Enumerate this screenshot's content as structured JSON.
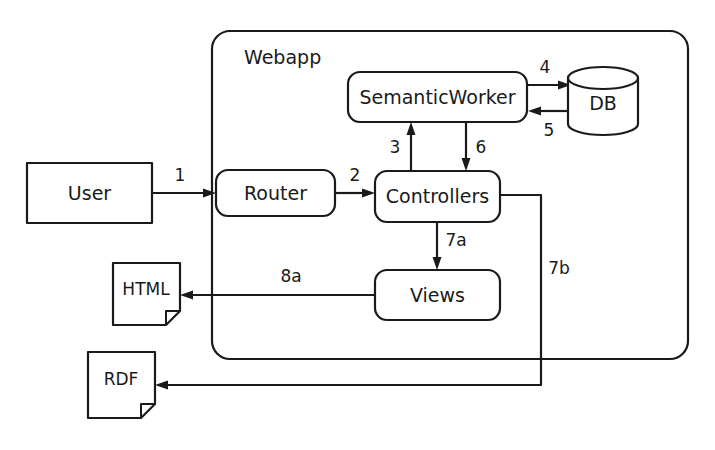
{
  "diagram": {
    "background_color": "#ffffff",
    "stroke_color": "#1a1a1a",
    "container": {
      "label": "Webapp",
      "shape": "rounded-rectangle"
    },
    "nodes": [
      {
        "id": "user",
        "label": "User",
        "shape": "rectangle"
      },
      {
        "id": "router",
        "label": "Router",
        "shape": "rounded-rectangle"
      },
      {
        "id": "controllers",
        "label": "Controllers",
        "shape": "rounded-rectangle"
      },
      {
        "id": "semantic-worker",
        "label": "SemanticWorker",
        "shape": "rounded-rectangle"
      },
      {
        "id": "db",
        "label": "DB",
        "shape": "cylinder"
      },
      {
        "id": "views",
        "label": "Views",
        "shape": "rounded-rectangle"
      },
      {
        "id": "html",
        "label": "HTML",
        "shape": "document"
      },
      {
        "id": "rdf",
        "label": "RDF",
        "shape": "document"
      }
    ],
    "edges": [
      {
        "id": "e1",
        "label": "1",
        "from": "user",
        "to": "router",
        "direction": "forward"
      },
      {
        "id": "e2",
        "label": "2",
        "from": "router",
        "to": "controllers",
        "direction": "forward"
      },
      {
        "id": "e3",
        "label": "3",
        "from": "controllers",
        "to": "semantic-worker",
        "direction": "forward"
      },
      {
        "id": "e4",
        "label": "4",
        "from": "semantic-worker",
        "to": "db",
        "direction": "forward"
      },
      {
        "id": "e5",
        "label": "5",
        "from": "db",
        "to": "semantic-worker",
        "direction": "forward"
      },
      {
        "id": "e6",
        "label": "6",
        "from": "semantic-worker",
        "to": "controllers",
        "direction": "forward"
      },
      {
        "id": "e7a",
        "label": "7a",
        "from": "controllers",
        "to": "views",
        "direction": "forward"
      },
      {
        "id": "e7b",
        "label": "7b",
        "from": "controllers",
        "to": "rdf",
        "direction": "forward"
      },
      {
        "id": "e8a",
        "label": "8a",
        "from": "views",
        "to": "html",
        "direction": "forward"
      }
    ]
  }
}
